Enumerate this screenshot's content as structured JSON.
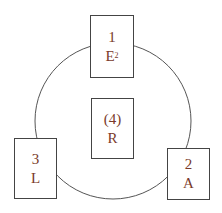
{
  "diagram": {
    "type": "cycle",
    "nodes": [
      {
        "id": "top",
        "number": "1",
        "letter": "E",
        "superscript": "2"
      },
      {
        "id": "right",
        "number": "2",
        "letter": "A"
      },
      {
        "id": "left",
        "number": "3",
        "letter": "L"
      },
      {
        "id": "center",
        "number": "(4)",
        "letter": "R"
      }
    ],
    "colors": {
      "text": "#7a3a2a",
      "stroke": "#444444"
    }
  }
}
